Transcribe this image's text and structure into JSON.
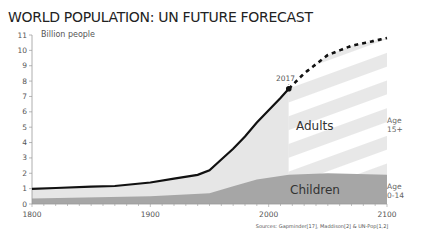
{
  "chart_data": {
    "type": "area",
    "title": "WORLD POPULATION: UN FUTURE FORECAST",
    "ylabel": "Billion people",
    "xlabel": "",
    "xlim": [
      1800,
      2100
    ],
    "ylim": [
      0,
      11
    ],
    "x_ticks": [
      1800,
      1900,
      2000,
      2100
    ],
    "y_ticks": [
      0,
      1,
      2,
      3,
      4,
      5,
      6,
      7,
      8,
      9,
      10,
      11
    ],
    "series": [
      {
        "name": "Total population",
        "x": [
          1800,
          1820,
          1850,
          1870,
          1900,
          1920,
          1940,
          1950,
          1960,
          1970,
          1980,
          1990,
          2000,
          2010,
          2017
        ],
        "values": [
          0.98,
          1.04,
          1.13,
          1.17,
          1.4,
          1.65,
          1.9,
          2.2,
          2.9,
          3.6,
          4.4,
          5.3,
          6.1,
          6.9,
          7.5
        ]
      },
      {
        "name": "Children (Age 0-14)",
        "x": [
          1800,
          1900,
          1950,
          1970,
          1990,
          2017,
          2050,
          2100
        ],
        "values": [
          0.35,
          0.5,
          0.7,
          1.15,
          1.6,
          1.9,
          2.0,
          1.9
        ]
      },
      {
        "name": "Forecast (UN)",
        "x": [
          2017,
          2030,
          2050,
          2070,
          2100
        ],
        "values": [
          7.5,
          8.5,
          9.7,
          10.3,
          10.8
        ]
      }
    ],
    "annotations": [
      {
        "text": "2017",
        "x": 2017
      },
      {
        "text": "Adults",
        "region": "adults"
      },
      {
        "text": "Children",
        "region": "children"
      },
      {
        "text": "Age 15+",
        "region": "adults-right"
      },
      {
        "text": "Age 0-14",
        "region": "children-right"
      }
    ],
    "source": "Sources: Gapminder[17], Maddison[2] & UN-Pop[1,2]"
  },
  "labels": {
    "title": "WORLD POPULATION: UN FUTURE FORECAST",
    "ylabel": "Billion people",
    "year_marker": "2017",
    "adults": "Adults",
    "children": "Children",
    "age_adults_1": "Age",
    "age_adults_2": "15+",
    "age_children_1": "Age",
    "age_children_2": "0-14",
    "source": "Sources: Gapminder[17], Maddison[2] & UN-Pop[1,2]"
  },
  "colors": {
    "adults": "#e6e6e6",
    "children": "#a6a6a6",
    "line": "#111111",
    "stripe": "#ffffff"
  }
}
